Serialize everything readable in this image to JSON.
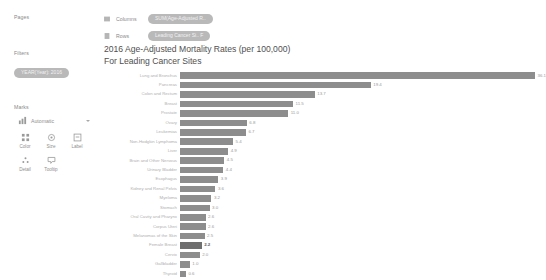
{
  "sidebar": {
    "pages_label": "Pages",
    "filters_label": "Filters",
    "filter_pill": "YEAR(Year): 2016",
    "marks_label": "Marks",
    "marks_type": "Automatic",
    "mark_buttons": [
      {
        "label": "Color",
        "icon": "color-icon"
      },
      {
        "label": "Size",
        "icon": "size-icon"
      },
      {
        "label": "Label",
        "icon": "label-icon"
      },
      {
        "label": "Detail",
        "icon": "detail-icon"
      },
      {
        "label": "Tooltip",
        "icon": "tooltip-icon"
      }
    ]
  },
  "shelves": {
    "columns_label": "Columns",
    "columns_pill": "SUM(Age-Adjusted R..",
    "rows_label": "Rows",
    "rows_pill": "Leading Cancer Si.. F"
  },
  "chart_data": {
    "type": "bar",
    "orientation": "horizontal",
    "title": "2016 Age-Adjusted Mortality Rates (per 100,000)\nFor Leading Cancer Sites",
    "title_line1": "2016 Age-Adjusted Mortality Rates (per 100,000)",
    "title_line2": "For Leading Cancer Sites",
    "xlabel": "",
    "ylabel": "",
    "xlim": [
      0,
      36.1
    ],
    "grid": false,
    "legend": "none",
    "categories": [
      "Lung and Bronchus",
      "Pancreas",
      "Colon and Rectum",
      "Breast",
      "Prostate",
      "Ovary",
      "Leukemias",
      "Non-Hodgkin Lymphoma",
      "Liver",
      "Brain and Other Nervous",
      "Urinary Bladder",
      "Esophagus",
      "Kidney and Renal Pelvis",
      "Myeloma",
      "Stomach",
      "Oral Cavity and Pharynx",
      "Corpus Uteri",
      "Melanomas of the Skin",
      "Female Breast",
      "Cervix",
      "Gallbladder",
      "Thyroid"
    ],
    "values": [
      36.1,
      19.4,
      13.7,
      11.5,
      11.0,
      6.8,
      6.7,
      5.4,
      4.9,
      4.5,
      4.4,
      3.9,
      3.6,
      3.2,
      3.0,
      2.6,
      2.6,
      2.5,
      2.2,
      2.0,
      1.0,
      0.6
    ],
    "labels": [
      "36.1",
      "19.4",
      "13.7",
      "11.5",
      "11.0",
      "6.8",
      "6.7",
      "5.4",
      "4.9",
      "4.5",
      "4.4",
      "3.9",
      "3.6",
      "3.2",
      "3.0",
      "2.6",
      "2.6",
      "2.5",
      "2.2",
      "2.0",
      "1.0",
      "0.6"
    ],
    "highlight_index": 18,
    "bar_color": "#8d8d8d",
    "highlight_color": "#6f6f6f"
  }
}
